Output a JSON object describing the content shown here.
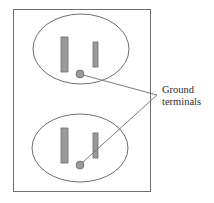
{
  "diagram": {
    "label": {
      "line1": "Ground",
      "line2": "terminals"
    },
    "colors": {
      "stroke": "#6e6e6e",
      "slot_fill": "#9a9a9a",
      "slot_stroke": "#6e6e6e",
      "ground_fill": "#9a9a9a",
      "text": "#2e2e2e",
      "background": "#ffffff"
    },
    "outlets": [
      {
        "name": "upper-outlet",
        "oval": {
          "cx": 81,
          "cy": 49,
          "rx": 48,
          "ry": 35
        },
        "large_slot": {
          "x": 61,
          "y": 37,
          "w": 7,
          "h": 35
        },
        "small_slot": {
          "x": 93,
          "y": 42,
          "w": 5,
          "h": 25
        },
        "ground": {
          "cx": 80,
          "cy": 74,
          "r": 4
        }
      },
      {
        "name": "lower-outlet",
        "oval": {
          "cx": 80,
          "cy": 148,
          "rx": 48,
          "ry": 34
        },
        "large_slot": {
          "x": 61,
          "y": 128,
          "w": 7,
          "h": 35
        },
        "small_slot": {
          "x": 93,
          "y": 133,
          "w": 5,
          "h": 25
        },
        "ground": {
          "cx": 80,
          "cy": 165,
          "r": 4
        }
      }
    ],
    "plate": {
      "x": 13,
      "y": 9,
      "w": 137,
      "h": 182
    },
    "leader_point": {
      "x": 157,
      "y": 95
    }
  }
}
